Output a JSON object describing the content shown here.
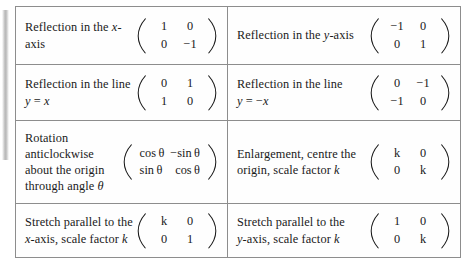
{
  "document": {
    "title": "Matrices for common transformations",
    "type": "reference-table"
  },
  "table": {
    "rows": [
      {
        "left": {
          "description_lines": [
            "Reflection in the x-axis"
          ],
          "matrix": {
            "r1c1": "1",
            "r1c2": "0",
            "r2c1": "0",
            "r2c2": "−1"
          }
        },
        "right": {
          "description_lines": [
            "Reflection in the y-axis"
          ],
          "matrix": {
            "r1c1": "−1",
            "r1c2": "0",
            "r2c1": "0",
            "r2c2": "1"
          }
        }
      },
      {
        "left": {
          "description_lines": [
            "Reflection in the line y = x"
          ],
          "matrix": {
            "r1c1": "0",
            "r1c2": "1",
            "r2c1": "1",
            "r2c2": "0"
          }
        },
        "right": {
          "description_lines": [
            "Reflection in the line",
            "y = −x"
          ],
          "matrix": {
            "r1c1": "0",
            "r1c2": "−1",
            "r2c1": "−1",
            "r2c2": "0"
          }
        }
      },
      {
        "left": {
          "description_lines": [
            "Rotation",
            "anticlockwise",
            "about the origin",
            "through angle θ"
          ],
          "matrix": {
            "r1c1": "cos θ",
            "r1c2": "−sin θ",
            "r2c1": "sin θ",
            "r2c2": "cos θ"
          }
        },
        "right": {
          "description_lines": [
            "Enlargement, centre the",
            "origin, scale factor k"
          ],
          "matrix": {
            "r1c1": "k",
            "r1c2": "0",
            "r2c1": "0",
            "r2c2": "k"
          }
        }
      },
      {
        "left": {
          "description_lines": [
            "Stretch parallel to the",
            "x-axis, scale factor k"
          ],
          "matrix": {
            "r1c1": "k",
            "r1c2": "0",
            "r2c1": "0",
            "r2c2": "1"
          }
        },
        "right": {
          "description_lines": [
            "Stretch parallel to the",
            "y-axis, scale factor k"
          ],
          "matrix": {
            "r1c1": "1",
            "r1c2": "0",
            "r2c1": "0",
            "r2c2": "k"
          }
        }
      }
    ]
  },
  "style": {
    "border_color": "#8d8d8d",
    "text_color": "#1a1a1a",
    "background": "#ffffff"
  }
}
